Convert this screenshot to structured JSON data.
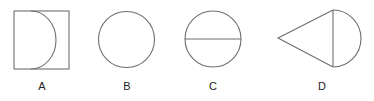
{
  "figures": [
    {
      "id": "A",
      "label": "A",
      "description": "square with inscribed semicircle arc on left"
    },
    {
      "id": "B",
      "label": "B",
      "description": "circle"
    },
    {
      "id": "C",
      "label": "C",
      "description": "circle divided by horizontal diameter"
    },
    {
      "id": "D",
      "label": "D",
      "description": "triangle joined to semicircle (cone shape)"
    }
  ],
  "colors": {
    "stroke": "#6e6e6e",
    "background": "#ffffff",
    "text": "#222222"
  }
}
